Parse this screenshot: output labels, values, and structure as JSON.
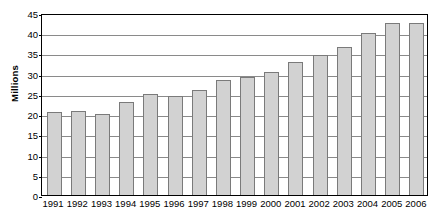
{
  "chart_data": {
    "type": "bar",
    "title": "",
    "xlabel": "",
    "ylabel": "Millions",
    "ylim": [
      0,
      45
    ],
    "ytick_step": 5,
    "yticks": [
      "45",
      "40",
      "35",
      "30",
      "25",
      "20",
      "15",
      "10",
      "5",
      "0"
    ],
    "grid": true,
    "legend": "none",
    "categories": [
      "1991",
      "1992",
      "1993",
      "1994",
      "1995",
      "1996",
      "1997",
      "1998",
      "1999",
      "2000",
      "2001",
      "2002",
      "2003",
      "2004",
      "2005",
      "2006"
    ],
    "values": [
      20.5,
      20.7,
      20.0,
      23.0,
      25.0,
      24.5,
      26.0,
      28.5,
      29.2,
      30.5,
      33.0,
      34.5,
      36.5,
      40.0,
      42.5,
      42.5
    ],
    "bar_fill_color": "#d2d2d2",
    "bar_border_color": "#7a7a7a",
    "gridline_color": "#8a8a8a",
    "frame_color": "#000000"
  }
}
